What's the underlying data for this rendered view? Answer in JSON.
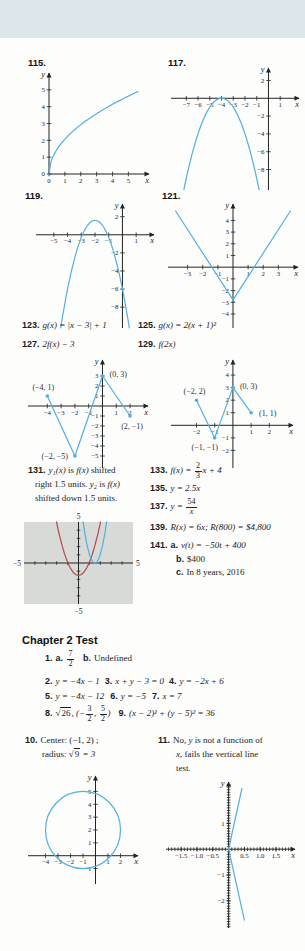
{
  "colors": {
    "curve": "#54afdf",
    "red": "#b3484f",
    "axis": "#232323",
    "calc_bg": "#d7dad6",
    "band": "#dde8ec",
    "text": "#1c1c1e"
  },
  "labels": {
    "e115": "115.",
    "e117": "117.",
    "e119": "119.",
    "e121": "121."
  },
  "heading": "Chapter 2 Test",
  "rows": {
    "r123": [
      {
        "b": "123."
      },
      {
        "m": "g(x) = |x − 3| + 1"
      }
    ],
    "r125": [
      {
        "b": "125."
      },
      {
        "m": "g(x) = 2(x + 1)²"
      }
    ],
    "r127": [
      {
        "b": "127."
      },
      {
        "m": "2f(x) − 3"
      }
    ],
    "r129": [
      {
        "b": "129."
      },
      {
        "m": "f(2x)"
      }
    ],
    "r131a": [
      {
        "b": "131."
      },
      {
        "m": "y₁(x)"
      },
      {
        "r": " is "
      },
      {
        "m": "f(x)"
      },
      {
        "r": " shifted"
      }
    ],
    "r131b": [
      {
        "r": "right 1.5 units. "
      },
      {
        "m": "y₂"
      },
      {
        "r": " is "
      },
      {
        "m": "f(x)"
      }
    ],
    "r131c": [
      {
        "r": "shifted down 1.5 units."
      }
    ],
    "r133": [
      {
        "b": "133."
      },
      {
        "m": "f(x) = "
      },
      {
        "f": [
          "2",
          "3"
        ]
      },
      {
        "m": "x + 4"
      }
    ],
    "r135": [
      {
        "b": "135."
      },
      {
        "m": "y = 2.5x"
      }
    ],
    "r137": [
      {
        "b": "137."
      },
      {
        "m": "y = "
      },
      {
        "f": [
          "54",
          "x"
        ]
      }
    ],
    "r139": [
      {
        "b": "139."
      },
      {
        "m": "R(x) = 6x; R(800) = $4,800"
      }
    ],
    "r141a": [
      {
        "b": "141."
      },
      {
        "b": "a."
      },
      {
        "m": "v(t) = −50t + 400"
      }
    ],
    "r141b": [
      {
        "b": "b."
      },
      {
        "r": "$400"
      }
    ],
    "r141c": [
      {
        "b": "c."
      },
      {
        "r": "In 8 years, 2016"
      }
    ],
    "t1": [
      {
        "b": "1."
      },
      {
        "b": "a."
      },
      {
        "f": [
          "7",
          "2"
        ]
      },
      {
        "g": 8
      },
      {
        "b": "b."
      },
      {
        "r": "Undefined"
      }
    ],
    "t2": [
      {
        "b": "2."
      },
      {
        "m": "y = −4x − 1"
      },
      {
        "g": 5
      },
      {
        "b": "3."
      },
      {
        "m": "x + y − 3 = 0"
      },
      {
        "g": 5
      },
      {
        "b": "4."
      },
      {
        "m": "y = −2x + 6"
      }
    ],
    "t5": [
      {
        "b": "5."
      },
      {
        "m": "y = −4x − 12"
      },
      {
        "g": 6
      },
      {
        "b": "6."
      },
      {
        "m": "y = −5"
      },
      {
        "g": 6
      },
      {
        "b": "7."
      },
      {
        "m": "x = 7"
      }
    ],
    "t8": [
      {
        "b": "8."
      },
      {
        "q": "26"
      },
      {
        "m": ", (−"
      },
      {
        "f": [
          "3",
          "2"
        ]
      },
      {
        "m": ", "
      },
      {
        "f": [
          "5",
          "2"
        ]
      },
      {
        "m": ")"
      },
      {
        "g": 8
      },
      {
        "b": "9."
      },
      {
        "m": "(x − 2)² + (y − 5)² = 36"
      }
    ],
    "t10a": [
      {
        "b": "10."
      },
      {
        "r": "Center: (−1, 2) ;"
      }
    ],
    "t10b": [
      {
        "r": "radius: "
      },
      {
        "q": "9"
      },
      {
        "m": " = 3"
      }
    ],
    "t11a": [
      {
        "b": "11."
      },
      {
        "r": "No, "
      },
      {
        "m": "y"
      },
      {
        "r": " is not a function of"
      }
    ],
    "t11b": [
      {
        "m": "x"
      },
      {
        "r": ", fails the vertical line"
      }
    ],
    "t11c": [
      {
        "r": "test."
      }
    ]
  },
  "graphs": {
    "g115": {
      "xmin": 0,
      "xmax": 6.3,
      "ymin": 0,
      "ymax": 6.0,
      "m": [
        7,
        9,
        14,
        13
      ],
      "xlabel": "x",
      "ylabel": "y",
      "xt": {
        "v": [
          0,
          1,
          2,
          3,
          4,
          5
        ],
        "l": [
          "0",
          "1",
          "2",
          "3",
          "4",
          "5"
        ]
      },
      "yt": {
        "v": [
          0,
          1,
          2,
          3,
          4,
          5
        ],
        "l": [
          "0",
          "1",
          "2",
          "3",
          "4",
          "5"
        ]
      },
      "curves": [
        {
          "t": "sqrt",
          "c": 2.07,
          "x1": 0,
          "x2": 5.6
        }
      ]
    },
    "g117": {
      "xmin": -8.3,
      "xmax": 2.6,
      "ymin": -10.3,
      "ymax": 3.4,
      "m": [
        6,
        6,
        6,
        8
      ],
      "xlabel": "x",
      "ylabel": "y",
      "xt": {
        "v": [
          -7,
          -6,
          -5,
          -4,
          -3,
          -2,
          -1,
          1
        ],
        "l": [
          "−7",
          "−6",
          "−5",
          "−4",
          "−3",
          "−2",
          "−1",
          "1"
        ]
      },
      "yt": {
        "v": [
          2,
          -2,
          -4,
          -6,
          -8
        ],
        "l": [
          "2",
          "−2",
          "−4",
          "−6",
          "−8"
        ]
      },
      "curves": [
        {
          "t": "quad",
          "a": -1,
          "h": -4,
          "v": 0,
          "x1": -7.2,
          "x2": -0.8
        }
      ]
    },
    "g119": {
      "xmin": -6.3,
      "xmax": 2.3,
      "ymin": -10.3,
      "ymax": 3.4,
      "m": [
        6,
        6,
        6,
        8
      ],
      "xlabel": "x",
      "ylabel": "y",
      "xt": {
        "v": [
          -5,
          -4,
          -3,
          -2,
          -1,
          1
        ],
        "l": [
          "−5",
          "−4",
          "−3",
          "−2",
          "−1",
          "1"
        ]
      },
      "yt": {
        "v": [
          2,
          -2,
          -4,
          -6,
          -8
        ],
        "l": [
          "2",
          "−2",
          "−4",
          "−6",
          "−8"
        ]
      },
      "curves": [
        {
          "t": "quad",
          "a": -1.9,
          "h": -2,
          "v": 1.6,
          "x1": -4.5,
          "x2": 0.5
        }
      ]
    },
    "g121": {
      "xmin": -4.3,
      "xmax": 4.3,
      "ymin": -5.2,
      "ymax": 5.4,
      "m": [
        6,
        6,
        6,
        8
      ],
      "xlabel": "x",
      "ylabel": "y",
      "xt": {
        "v": [
          -3,
          -2,
          -1,
          1,
          2,
          3
        ],
        "l": [
          "−3",
          "−2",
          "−1",
          "1",
          "2",
          "3"
        ]
      },
      "yt": {
        "v": [
          4,
          3,
          2,
          1,
          -1,
          -2,
          -3,
          -4
        ],
        "l": [
          "4",
          "3",
          "2",
          "1",
          "−1",
          "−2",
          "−3",
          "−4"
        ]
      },
      "curves": [
        {
          "t": "poly",
          "p": [
            [
              -3.8,
              4.8
            ],
            [
              0,
              -2.8
            ],
            [
              3.8,
              4.8
            ]
          ]
        }
      ]
    },
    "gA": {
      "xmin": -5.4,
      "xmax": 3.3,
      "ymin": -6.2,
      "ymax": 4.6,
      "m": [
        6,
        6,
        6,
        8
      ],
      "xlabel": "x",
      "ylabel": "y",
      "xt": {
        "v": [
          -4,
          -3,
          -2,
          -1,
          1,
          2
        ],
        "l": [
          "−4",
          "−3",
          "−2",
          "−1",
          "1",
          "2"
        ]
      },
      "yt": {
        "v": [
          3,
          2,
          1,
          -1,
          -2,
          -3,
          -4,
          -5
        ],
        "l": [
          "3",
          "2",
          "1",
          "−1",
          "−2",
          "−3",
          "−4",
          "−5"
        ]
      },
      "curves": [
        {
          "t": "poly",
          "p": [
            [
              -4,
              1
            ],
            [
              -2,
              -5
            ],
            [
              0,
              3
            ],
            [
              2,
              -1
            ]
          ]
        }
      ],
      "pts": [
        {
          "x": -4,
          "y": 1,
          "t": "(−4, 1)",
          "dx": -4,
          "dy": -6,
          "a": "middle"
        },
        {
          "x": 0,
          "y": 3,
          "t": "(0, 3)",
          "dx": 7,
          "dy": 1,
          "a": "start"
        },
        {
          "x": 2,
          "y": -1,
          "t": "(2, −1)",
          "dx": 2,
          "dy": 13,
          "a": "middle"
        },
        {
          "x": -2,
          "y": -5,
          "t": "(−2, −5)",
          "dx": -7,
          "dy": 3,
          "a": "end"
        }
      ]
    },
    "gB": {
      "xmin": -3.4,
      "xmax": 3.3,
      "ymin": -3.4,
      "ymax": 5.2,
      "m": [
        6,
        6,
        6,
        8
      ],
      "xlabel": "x",
      "ylabel": "y",
      "xt": {
        "v": [
          -2,
          -1,
          1,
          2
        ],
        "l": [
          "−2",
          "−1",
          "1",
          "2"
        ]
      },
      "yt": {
        "v": [
          4,
          3,
          2,
          1,
          -1,
          -2
        ],
        "l": [
          "4",
          "3",
          "2",
          "1",
          "−1",
          "−2"
        ]
      },
      "curves": [
        {
          "t": "poly",
          "p": [
            [
              -2,
              2
            ],
            [
              -1,
              -1
            ],
            [
              0,
              3
            ],
            [
              1,
              1
            ]
          ]
        }
      ],
      "pts": [
        {
          "x": -2,
          "y": 2,
          "t": "(−2, 2)",
          "dx": -2,
          "dy": -6,
          "a": "middle"
        },
        {
          "x": 0,
          "y": 3,
          "t": "(0, 3)",
          "dx": 7,
          "dy": 1,
          "a": "start"
        },
        {
          "x": 1,
          "y": 1,
          "t": "(1, 1)",
          "dx": 8,
          "dy": 3,
          "a": "start"
        },
        {
          "x": -1,
          "y": -1,
          "t": "(−1, −1)",
          "dx": -10,
          "dy": 12,
          "a": "middle"
        }
      ]
    },
    "calc": {
      "xmin": -5,
      "xmax": 5,
      "ymin": -5,
      "ymax": 5,
      "m": [
        10,
        15,
        12,
        16
      ],
      "panel": true,
      "arrows": false,
      "xm": 1,
      "ym": 1,
      "corner": {
        "t": "5",
        "b": "−5",
        "l": "−5",
        "r": "5"
      },
      "curves": [
        {
          "t": "quad",
          "a": 1.6,
          "h": 0,
          "v": -1.5,
          "x1": -2.02,
          "x2": 2.02,
          "col": "#b3484f"
        },
        {
          "t": "quad",
          "a": 4.3,
          "h": 1.5,
          "v": 0,
          "x1": 0.42,
          "x2": 2.58
        }
      ]
    },
    "gCircle": {
      "xmin": -5.4,
      "xmax": 3.4,
      "ymin": -2.2,
      "ymax": 6.2,
      "m": [
        6,
        6,
        6,
        8
      ],
      "xlabel": "x",
      "ylabel": "y",
      "xt": {
        "v": [
          -4,
          -3,
          -2,
          -1,
          1,
          2
        ],
        "l": [
          "−4",
          "−3",
          "−2",
          "−1",
          "1",
          "2"
        ]
      },
      "yt": {
        "v": [
          5,
          4,
          3,
          2,
          1,
          -1
        ],
        "l": [
          "5",
          "4",
          "3",
          "2",
          "1",
          "−1"
        ]
      },
      "curves": [
        {
          "t": "circle",
          "cx": -1,
          "cy": 2,
          "r": 3
        }
      ]
    },
    "g11": {
      "xmin": -1.98,
      "xmax": 2.1,
      "ymin": -3.05,
      "ymax": 2.6,
      "m": [
        6,
        8,
        6,
        8
      ],
      "xlabel": "x",
      "ylabel": "y",
      "xm": 0.1,
      "ym": 0.1,
      "xt": {
        "v": [
          -1.5,
          -1.0,
          -0.5,
          0.5,
          1.0,
          1.5
        ],
        "l": [
          "−1.5",
          "−1.0",
          "−0.5",
          "0.5",
          "1.0",
          "1.5"
        ]
      },
      "yt": {
        "v": [
          1,
          -1,
          -2
        ],
        "l": [
          "1",
          "−1",
          "−2"
        ]
      },
      "curves": [
        {
          "t": "poly",
          "p": [
            [
              0.42,
              2.35
            ],
            [
              0,
              0
            ],
            [
              0.5,
              -2.75
            ]
          ]
        }
      ]
    }
  }
}
